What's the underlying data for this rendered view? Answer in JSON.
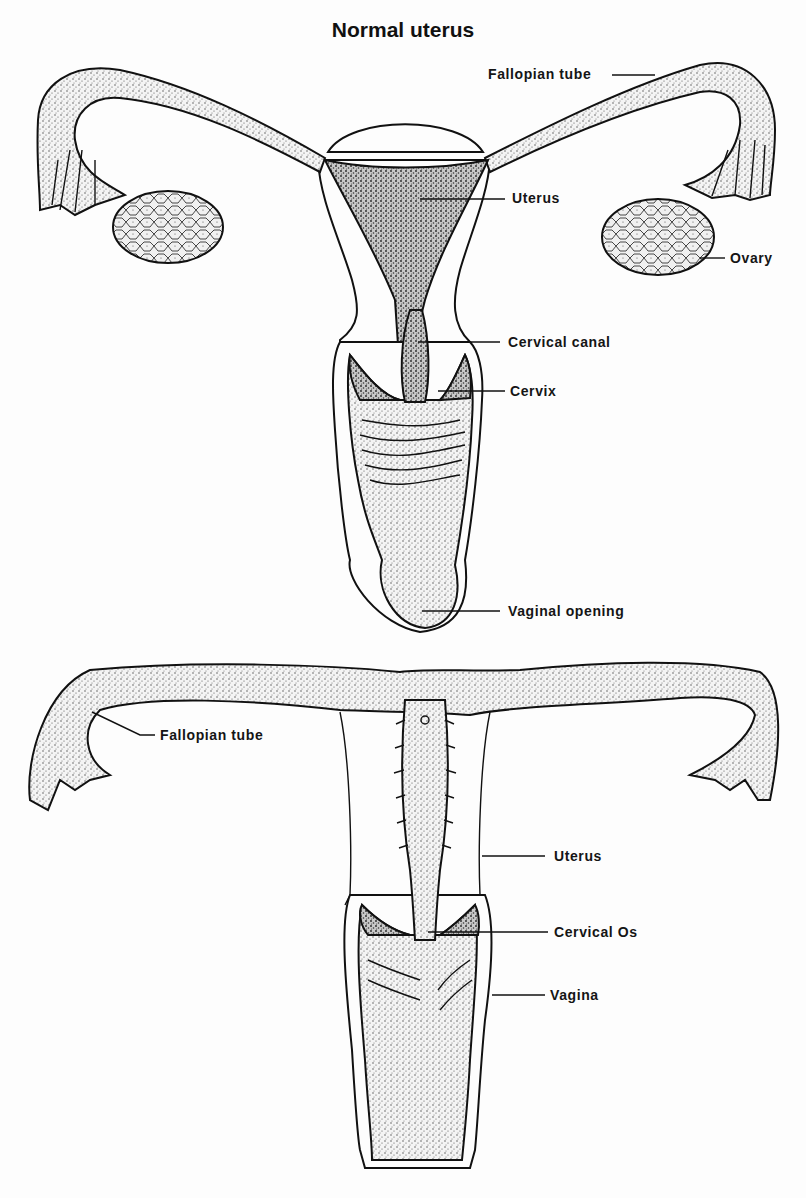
{
  "title": "Normal uterus",
  "figures": [
    {
      "name": "top-figure",
      "labels": [
        {
          "id": "fallopian_tube",
          "text": "Fallopian tube"
        },
        {
          "id": "uterus",
          "text": "Uterus"
        },
        {
          "id": "ovary",
          "text": "Ovary"
        },
        {
          "id": "cervical_canal",
          "text": "Cervical canal"
        },
        {
          "id": "cervix",
          "text": "Cervix"
        },
        {
          "id": "vaginal_opening",
          "text": "Vaginal opening"
        }
      ]
    },
    {
      "name": "bottom-figure",
      "labels": [
        {
          "id": "fallopian_tube",
          "text": "Fallopian tube"
        },
        {
          "id": "uterus",
          "text": "Uterus"
        },
        {
          "id": "cervical_os",
          "text": "Cervical Os"
        },
        {
          "id": "vagina",
          "text": "Vagina"
        }
      ]
    }
  ],
  "colors": {
    "ink": "#111111",
    "paper": "#fdfdfd"
  }
}
